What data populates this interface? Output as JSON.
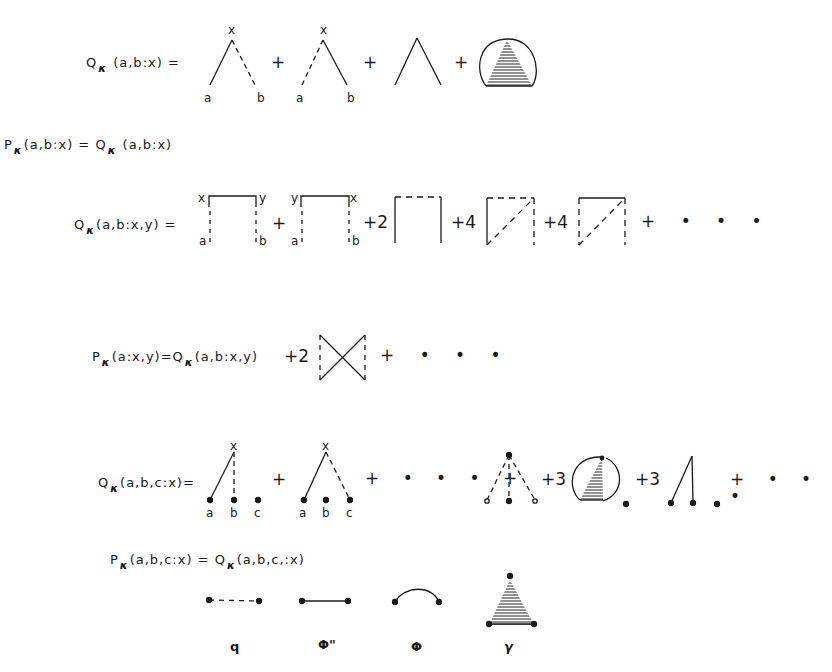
{
  "equations": {
    "eq1": {
      "lhs_prefix": "Q",
      "lhs_sub": "κ",
      "lhs_args": "(a,b:x) =",
      "labels": {
        "x": "x",
        "a": "a",
        "b": "b"
      },
      "ops": [
        "+",
        "+",
        "+"
      ]
    },
    "eq2": {
      "text_prefix": "P",
      "text_sub": "κ",
      "text_mid": "(a,b:x) = Q",
      "text_sub2": "κ",
      "text_end": "(a,b:x)"
    },
    "eq3": {
      "lhs_prefix": "Q",
      "lhs_sub": "κ",
      "lhs_args": "(a,b:x,y) =",
      "labels": {
        "x": "x",
        "y": "y",
        "a": "a",
        "b": "b"
      },
      "ops": [
        "+",
        "+2",
        "+4",
        "+4",
        "+ • • •"
      ]
    },
    "eq4": {
      "lhs_prefix": "P",
      "lhs_sub": "κ",
      "lhs_mid": "(a:x,y)=Q",
      "lhs_sub2": "κ",
      "lhs_end": "(a,b:x,y)",
      "ops": [
        "+2",
        "+ • • •"
      ]
    },
    "eq5": {
      "lhs_prefix": "Q",
      "lhs_sub": "κ",
      "lhs_args": "(a,b,c:x)=",
      "labels": {
        "x": "x",
        "a": "a",
        "b": "b",
        "c": "c"
      },
      "ops": [
        "+",
        "+ • • • +",
        "+3",
        "+3",
        "+ • • •"
      ]
    },
    "eq6": {
      "text_prefix": "P",
      "text_sub": "κ",
      "text_mid": "(a,b,c:x) = Q",
      "text_sub2": "κ",
      "text_end": "(a,b,c,:x)"
    }
  },
  "legend": {
    "items": [
      {
        "symbol": "dashed-line",
        "label": "q"
      },
      {
        "symbol": "solid-line",
        "label": "Φ\""
      },
      {
        "symbol": "arc",
        "label": "Φ"
      },
      {
        "symbol": "shaded-triangle",
        "label": "γ"
      }
    ]
  },
  "colors": {
    "ink": "#1a1a1a",
    "background": "#ffffff"
  }
}
